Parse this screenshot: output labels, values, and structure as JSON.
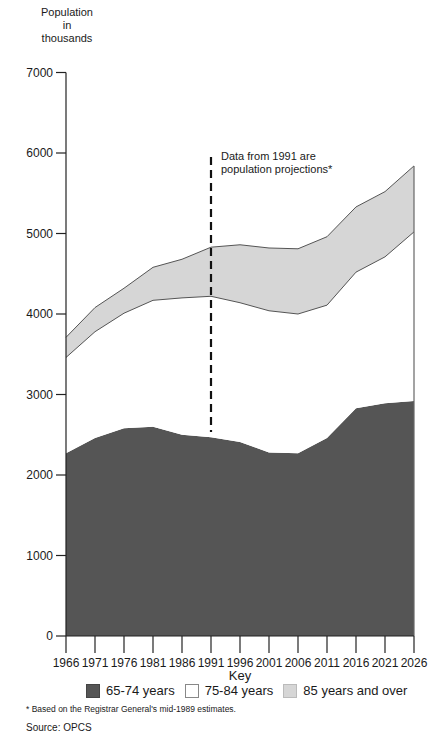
{
  "chart_data": {
    "type": "area",
    "stacked": true,
    "title": "",
    "ylabel": "Population in thousands",
    "xlabel": "",
    "ylim": [
      0,
      7000
    ],
    "yticks": [
      0,
      1000,
      2000,
      3000,
      4000,
      5000,
      6000,
      7000
    ],
    "categories": [
      "1966",
      "1971",
      "1976",
      "1981",
      "1986",
      "1991",
      "1996",
      "2001",
      "2006",
      "2011",
      "2016",
      "2021",
      "2026"
    ],
    "series": [
      {
        "name": "65-74 years",
        "color": "#555555",
        "values": [
          2270,
          2460,
          2580,
          2600,
          2500,
          2470,
          2410,
          2280,
          2270,
          2460,
          2830,
          2890,
          2920
        ]
      },
      {
        "name": "75-84 years",
        "color": "#ffffff",
        "values": [
          1190,
          1320,
          1430,
          1570,
          1700,
          1750,
          1730,
          1760,
          1730,
          1650,
          1690,
          1820,
          2100
        ]
      },
      {
        "name": "85 years and over",
        "color": "#d6d6d6",
        "values": [
          250,
          300,
          310,
          410,
          480,
          610,
          720,
          780,
          810,
          850,
          810,
          810,
          820
        ]
      }
    ],
    "annotations": [
      {
        "text": "Data from 1991 are population projections*",
        "x": "1991",
        "style": "dashed vertical line"
      }
    ],
    "legend": {
      "title": "Key",
      "position": "bottom"
    },
    "grid": false
  },
  "labels": {
    "ylabel_line1": "Population",
    "ylabel_line2": "in",
    "ylabel_line3": "thousands",
    "annotation_line1": "Data from 1991 are",
    "annotation_line2": "population projections*",
    "key_title": "Key",
    "legend": [
      "65-74 years",
      "75-84 years",
      "85 years and over"
    ],
    "footnote": "* Based on the Registrar General's mid-1989 estimates.",
    "source": "Source: OPCS"
  }
}
